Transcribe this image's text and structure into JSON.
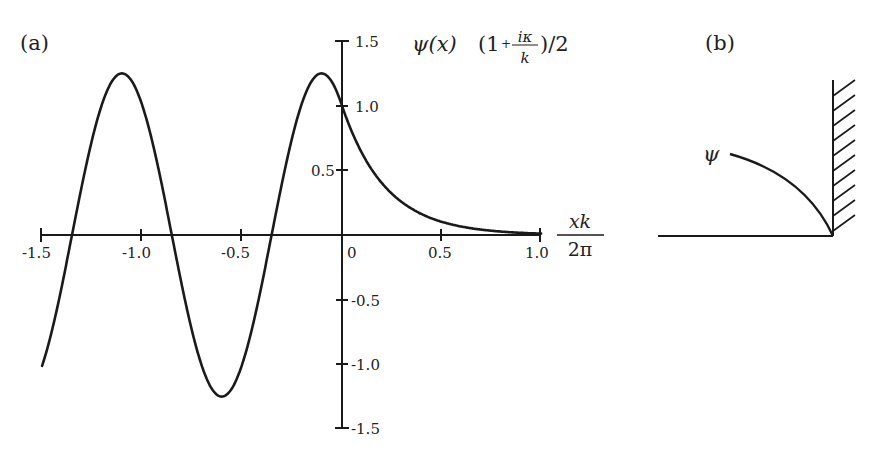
{
  "panel_a": {
    "label": "(a)",
    "y_label": {
      "func": "ψ(x)",
      "factor_open": "(1",
      "plus": "+",
      "frac_num": "iκ",
      "frac_den": "k",
      "factor_close": ")/2"
    },
    "x_label": {
      "num": "xk",
      "den": "2π"
    },
    "x_ticks": [
      "-1.5",
      "-1.0",
      "-0.5",
      "0",
      "0.5",
      "1.0"
    ],
    "y_ticks_pos": [
      "1.5",
      "1.0",
      "0.5"
    ],
    "y_ticks_neg": [
      "-0.5",
      "-1.0",
      "-1.5"
    ]
  },
  "panel_b": {
    "label": "(b)",
    "curve_label": "ψ"
  },
  "chart_data": {
    "type": "line",
    "title": "",
    "xlabel": "xk/2π",
    "ylabel": "ψ(x) (1 + iκ/k)/2",
    "xlim": [
      -1.5,
      1.0
    ],
    "ylim": [
      -1.5,
      1.5
    ],
    "x_ticks": [
      -1.5,
      -1.0,
      -0.5,
      0,
      0.5,
      1.0
    ],
    "y_ticks": [
      -1.5,
      -1.0,
      -0.5,
      0.5,
      1.0,
      1.5
    ],
    "grid": false,
    "series": [
      {
        "name": "ψ(x)",
        "x": [
          -1.5,
          -1.4,
          -1.3,
          -1.2,
          -1.1,
          -1.0,
          -0.9,
          -0.8,
          -0.7,
          -0.6,
          -0.5,
          -0.4,
          -0.3,
          -0.2,
          -0.1,
          0.0,
          0.1,
          0.2,
          0.3,
          0.4,
          0.5,
          0.6,
          0.7,
          0.8,
          0.9,
          1.0
        ],
        "y": [
          -1.01,
          -0.39,
          0.39,
          1.01,
          1.25,
          1.01,
          0.39,
          -0.39,
          -1.01,
          -1.25,
          -1.01,
          -0.39,
          0.39,
          1.01,
          1.25,
          1.01,
          0.63,
          0.4,
          0.25,
          0.16,
          0.1,
          0.06,
          0.04,
          0.02,
          0.01,
          0.0
        ]
      }
    ],
    "annotations": [
      "(a)",
      "(b)",
      "ψ"
    ]
  }
}
